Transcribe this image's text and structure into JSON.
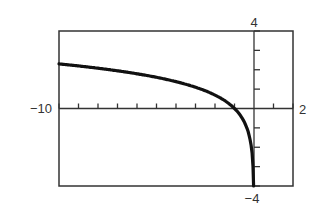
{
  "chart_data": {
    "type": "line",
    "title": "",
    "xlabel": "",
    "ylabel": "",
    "xlim": [
      -10,
      2
    ],
    "ylim": [
      -4,
      4
    ],
    "xscale_tick": 1,
    "yscale_tick": 1,
    "grid": false,
    "legend": null,
    "window_labels": {
      "xmin": "−10",
      "xmax": "2",
      "ymax": "4",
      "ymin": "−4"
    },
    "series": [
      {
        "name": "y = ln(-x)",
        "x": [
          -10,
          -9,
          -8,
          -7,
          -6,
          -5,
          -4,
          -3,
          -2,
          -1.5,
          -1,
          -0.7,
          -0.5,
          -0.3,
          -0.2,
          -0.1,
          -0.05,
          -0.0183
        ],
        "y": [
          2.3,
          2.2,
          2.08,
          1.95,
          1.79,
          1.61,
          1.39,
          1.1,
          0.69,
          0.41,
          0.0,
          -0.36,
          -0.69,
          -1.2,
          -1.61,
          -2.3,
          -3.0,
          -4.0
        ]
      }
    ]
  },
  "colors": {
    "frame": "#333333",
    "curve": "#111111",
    "background": "#ffffff"
  }
}
